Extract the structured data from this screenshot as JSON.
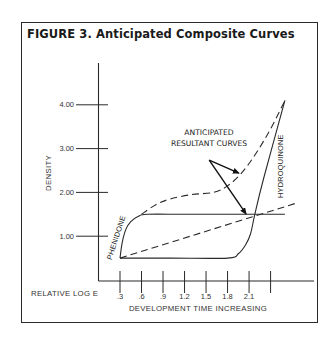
{
  "figure": {
    "title": "FIGURE 3. Anticipated Composite Curves"
  },
  "chart_data": {
    "type": "line",
    "title": "FIGURE 3. Anticipated Composite Curves",
    "xlabel": "DEVELOPMENT TIME INCREASING",
    "xlabel_left": "RELATIVE LOG E",
    "ylabel": "DENSITY",
    "xlim": [
      0,
      3.1
    ],
    "ylim": [
      0,
      5.0
    ],
    "x_ticks": [
      0.3,
      0.6,
      0.9,
      1.2,
      1.5,
      1.8,
      2.1,
      2.4
    ],
    "x_tick_labels": [
      ".3",
      ".6",
      ".9",
      "1.2",
      "1.5",
      "1.8",
      "2.1",
      ""
    ],
    "y_ticks": [
      1.0,
      2.0,
      3.0,
      4.0
    ],
    "y_tick_labels": [
      "1.00",
      "2.00",
      "3.00",
      "4.00"
    ],
    "grid": false,
    "series": [
      {
        "name": "PHENIDONE",
        "style": "solid",
        "x": [
          0.3,
          0.33,
          0.38,
          0.45,
          0.55,
          0.68,
          1.2,
          2.0,
          2.6
        ],
        "y": [
          0.5,
          0.85,
          1.15,
          1.33,
          1.45,
          1.5,
          1.5,
          1.5,
          1.5
        ]
      },
      {
        "name": "HYDROQUINONE",
        "style": "solid",
        "x": [
          0.3,
          1.0,
          1.8,
          1.95,
          2.05,
          2.12,
          2.18,
          2.3,
          2.6
        ],
        "y": [
          0.5,
          0.5,
          0.5,
          0.6,
          0.8,
          1.05,
          1.5,
          2.3,
          4.1
        ]
      },
      {
        "name": "Anticipated resultant curve (upper)",
        "style": "dashed",
        "x": [
          0.6,
          0.8,
          1.0,
          1.3,
          1.6,
          1.8,
          2.0,
          2.2,
          2.4,
          2.6
        ],
        "y": [
          1.5,
          1.72,
          1.85,
          1.95,
          2.0,
          2.15,
          2.45,
          2.9,
          3.45,
          4.1
        ]
      },
      {
        "name": "Anticipated resultant curve (lower)",
        "style": "dashed",
        "x": [
          0.3,
          2.75
        ],
        "y": [
          0.5,
          1.75
        ]
      }
    ],
    "annotations": [
      {
        "text_lines": [
          "ANTICIPATED",
          "RESULTANT CURVES"
        ],
        "origin": {
          "x": 1.0,
          "y": 2.75
        },
        "arrows_to": [
          {
            "x": 1.33,
            "y": 2.45
          },
          {
            "x": 1.43,
            "y": 1.52
          }
        ]
      }
    ],
    "curve_labels": [
      {
        "text": "PHENIDONE",
        "x": 0.32,
        "y": 0.95,
        "rotation": "vertical-up"
      },
      {
        "text": "HYDROQUINONE",
        "x": 2.47,
        "y": 2.6,
        "rotation": "vertical-up"
      }
    ]
  }
}
